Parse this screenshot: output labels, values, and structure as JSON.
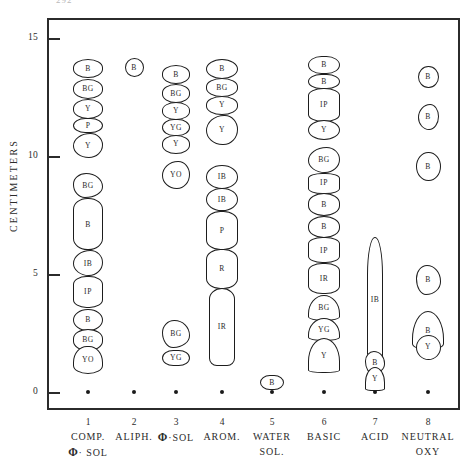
{
  "figure": {
    "page_artifact": "292",
    "y_axis_label": "CENTIMETERS",
    "y_ticks": [
      "0",
      "5",
      "10",
      "15"
    ],
    "y_range": [
      -0.6,
      16.0
    ],
    "x_numbers": [
      "1",
      "2",
      "3",
      "4",
      "5",
      "6",
      "7",
      "8"
    ],
    "ink_color": "#1d1d1d",
    "background": "#ffffff"
  },
  "lanes": [
    {
      "number": "1",
      "name_line1": "COMP.",
      "name_line2": "Φ· SOL",
      "has_phi_line1": false,
      "has_phi_line2": true
    },
    {
      "number": "2",
      "name_line1": "ALIPH.",
      "name_line2": "",
      "has_phi_line1": false,
      "has_phi_line2": false
    },
    {
      "number": "3",
      "name_line1": "Φ·SOL",
      "name_line2": "",
      "has_phi_line1": true,
      "has_phi_line2": false
    },
    {
      "number": "4",
      "name_line1": "AROM.",
      "name_line2": "",
      "has_phi_line1": false,
      "has_phi_line2": false
    },
    {
      "number": "5",
      "name_line1": "WATER",
      "name_line2": "SOL.",
      "has_phi_line1": false,
      "has_phi_line2": false
    },
    {
      "number": "6",
      "name_line1": "BASIC",
      "name_line2": "",
      "has_phi_line1": false,
      "has_phi_line2": false
    },
    {
      "number": "7",
      "name_line1": "ACID",
      "name_line2": "",
      "has_phi_line1": false,
      "has_phi_line2": false
    },
    {
      "number": "8",
      "name_line1": "NEUTRAL",
      "name_line2": "OXY",
      "has_phi_line1": false,
      "has_phi_line2": false
    }
  ],
  "chart_data": {
    "type": "scatter",
    "title": "",
    "xlabel": "",
    "ylabel": "CENTIMETERS",
    "ylim": [
      0,
      16
    ],
    "yticks": [
      0,
      5,
      10,
      15
    ],
    "grid": false,
    "legend": "none",
    "note": "Paper-chromatogram / TLC band map. Each lane is a fraction; each blob is a fluorescent band annotated with its colour code (B=blue, BG=blue-green, Y=yellow, YG=yellow-green, YO=yellow-orange, P=purple, IB=intense blue, IP=intense purple, IR=intense red, R=red).",
    "series": [
      {
        "name": "1 COMP. Φ·SOL",
        "x": 1,
        "bands": [
          {
            "label": "B",
            "center_cm": 13.7,
            "height_cm": 0.8
          },
          {
            "label": "BG",
            "center_cm": 12.85,
            "height_cm": 0.85
          },
          {
            "label": "Y",
            "center_cm": 12.0,
            "height_cm": 0.85
          },
          {
            "label": "P",
            "center_cm": 11.3,
            "height_cm": 0.65
          },
          {
            "label": "Y",
            "center_cm": 10.45,
            "height_cm": 1.05
          },
          {
            "label": "BG",
            "center_cm": 8.75,
            "height_cm": 1.05
          },
          {
            "label": "B",
            "center_cm": 7.1,
            "height_cm": 2.2
          },
          {
            "label": "IB",
            "center_cm": 5.45,
            "height_cm": 1.1
          },
          {
            "label": "IP",
            "center_cm": 4.25,
            "height_cm": 1.35
          },
          {
            "label": "B",
            "center_cm": 3.05,
            "height_cm": 0.95
          },
          {
            "label": "BG",
            "center_cm": 2.2,
            "height_cm": 0.9
          },
          {
            "label": "YO",
            "center_cm": 1.35,
            "height_cm": 1.2
          }
        ]
      },
      {
        "name": "2 ALIPH.",
        "x": 2,
        "bands": [
          {
            "label": "B",
            "center_cm": 13.75,
            "height_cm": 0.8
          }
        ]
      },
      {
        "name": "3 Φ·SOL",
        "x": 3,
        "bands": [
          {
            "label": "B",
            "center_cm": 13.45,
            "height_cm": 0.8
          },
          {
            "label": "BG",
            "center_cm": 12.65,
            "height_cm": 0.8
          },
          {
            "label": "Y",
            "center_cm": 11.9,
            "height_cm": 0.75
          },
          {
            "label": "YG",
            "center_cm": 11.2,
            "height_cm": 0.7
          },
          {
            "label": "Y",
            "center_cm": 10.5,
            "height_cm": 0.8
          },
          {
            "label": "YO",
            "center_cm": 9.2,
            "height_cm": 1.2
          },
          {
            "label": "BG",
            "center_cm": 2.45,
            "height_cm": 1.2
          },
          {
            "label": "YG",
            "center_cm": 1.45,
            "height_cm": 0.7
          }
        ]
      },
      {
        "name": "4 AROM.",
        "x": 4,
        "bands": [
          {
            "label": "B",
            "center_cm": 13.7,
            "height_cm": 0.85
          },
          {
            "label": "BG",
            "center_cm": 12.9,
            "height_cm": 0.8
          },
          {
            "label": "Y",
            "center_cm": 12.15,
            "height_cm": 0.8
          },
          {
            "label": "Y",
            "center_cm": 11.1,
            "height_cm": 1.3
          },
          {
            "label": "IB",
            "center_cm": 9.1,
            "height_cm": 1.0
          },
          {
            "label": "IB",
            "center_cm": 8.15,
            "height_cm": 1.0
          },
          {
            "label": "P",
            "center_cm": 6.85,
            "height_cm": 1.65
          },
          {
            "label": "R",
            "center_cm": 5.2,
            "height_cm": 1.7
          },
          {
            "label": "IR",
            "center_cm": 2.75,
            "height_cm": 3.3
          }
        ]
      },
      {
        "name": "5 WATER SOL.",
        "x": 5,
        "bands": [
          {
            "label": "B",
            "center_cm": 0.4,
            "height_cm": 0.65
          }
        ]
      },
      {
        "name": "6 BASIC",
        "x": 6,
        "bands": [
          {
            "label": "B",
            "center_cm": 13.85,
            "height_cm": 0.75
          },
          {
            "label": "B",
            "center_cm": 13.15,
            "height_cm": 0.65
          },
          {
            "label": "IP",
            "center_cm": 12.15,
            "height_cm": 1.45
          },
          {
            "label": "Y",
            "center_cm": 11.1,
            "height_cm": 0.85
          },
          {
            "label": "BG",
            "center_cm": 9.85,
            "height_cm": 1.1
          },
          {
            "label": "IP",
            "center_cm": 8.85,
            "height_cm": 0.9
          },
          {
            "label": "B",
            "center_cm": 7.95,
            "height_cm": 0.95
          },
          {
            "label": "B",
            "center_cm": 7.0,
            "height_cm": 0.95
          },
          {
            "label": "IP",
            "center_cm": 6.0,
            "height_cm": 1.1
          },
          {
            "label": "IR",
            "center_cm": 4.8,
            "height_cm": 1.3
          },
          {
            "label": "BG",
            "center_cm": 3.55,
            "height_cm": 1.1
          },
          {
            "label": "YG",
            "center_cm": 2.65,
            "height_cm": 1.0
          },
          {
            "label": "Y",
            "center_cm": 1.55,
            "height_cm": 1.5
          }
        ]
      },
      {
        "name": "7 ACID",
        "x": 7,
        "bands": [
          {
            "label": "IB",
            "center_cm": 3.9,
            "height_cm": 5.3
          },
          {
            "label": "B",
            "center_cm": 1.25,
            "height_cm": 0.95
          },
          {
            "label": "Y",
            "center_cm": 0.55,
            "height_cm": 1.0
          }
        ]
      },
      {
        "name": "8 NEUTRAL OXY",
        "x": 8,
        "bands": [
          {
            "label": "B",
            "center_cm": 13.35,
            "height_cm": 0.95
          },
          {
            "label": "B",
            "center_cm": 11.65,
            "height_cm": 1.1
          },
          {
            "label": "B",
            "center_cm": 9.55,
            "height_cm": 1.25
          },
          {
            "label": "B",
            "center_cm": 4.75,
            "height_cm": 1.25
          },
          {
            "label": "B",
            "center_cm": 2.6,
            "height_cm": 1.65
          },
          {
            "label": "Y",
            "center_cm": 1.9,
            "height_cm": 1.05
          }
        ]
      }
    ]
  }
}
